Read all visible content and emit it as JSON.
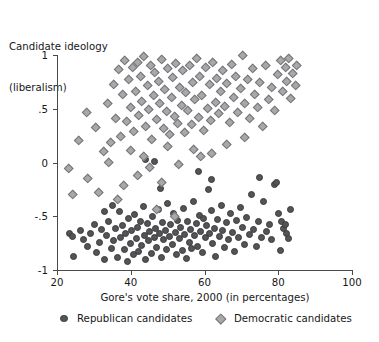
{
  "chart_data": {
    "type": "scatter",
    "title": "",
    "ylabel": "Candidate ideology (liberalism)",
    "ylabel_lines": [
      "Candidate ideology",
      "(liberalism)"
    ],
    "xlabel": "Gore's vote share, 2000 (in percentages)",
    "xlim": [
      20,
      100
    ],
    "ylim": [
      -1,
      1
    ],
    "xticks": [
      20,
      40,
      60,
      80,
      100
    ],
    "xtick_labels": [
      "20",
      "40",
      "60",
      "80",
      "100"
    ],
    "yticks": [
      1,
      0.5,
      0,
      -0.5,
      -1
    ],
    "ytick_labels": [
      "1",
      ".5",
      "0",
      "-.5",
      "-1"
    ],
    "grid": false,
    "legend_position": "bottom",
    "legend": [
      {
        "name": "Republican candidates",
        "marker": "circle",
        "color": "#545457"
      },
      {
        "name": "Democratic candidates",
        "marker": "diamond",
        "color": "#a8a8ab"
      }
    ],
    "series": [
      {
        "name": "Republican candidates",
        "marker": "circle",
        "color": "#545457",
        "points": [
          [
            23.4,
            -0.66
          ],
          [
            24.1,
            -0.69
          ],
          [
            24.6,
            -0.87
          ],
          [
            26.3,
            -0.63
          ],
          [
            27.1,
            -0.72
          ],
          [
            28.4,
            -0.78
          ],
          [
            29.2,
            -0.66
          ],
          [
            30.1,
            -0.58
          ],
          [
            30.8,
            -0.84
          ],
          [
            31.6,
            -0.74
          ],
          [
            32.2,
            -0.62
          ],
          [
            32.9,
            -0.9
          ],
          [
            33.5,
            -0.68
          ],
          [
            34.1,
            -0.55
          ],
          [
            34.8,
            -0.8
          ],
          [
            35.2,
            -0.73
          ],
          [
            35.9,
            -0.61
          ],
          [
            36.4,
            -0.88
          ],
          [
            36.9,
            -0.46
          ],
          [
            37.3,
            -0.7
          ],
          [
            37.8,
            -0.59
          ],
          [
            38.2,
            -0.81
          ],
          [
            38.7,
            -0.66
          ],
          [
            39.1,
            -0.92
          ],
          [
            39.5,
            -0.52
          ],
          [
            39.9,
            -0.75
          ],
          [
            40.3,
            -0.63
          ],
          [
            40.7,
            -0.86
          ],
          [
            41.1,
            -0.48
          ],
          [
            41.5,
            -0.71
          ],
          [
            41.9,
            -0.6
          ],
          [
            42.2,
            -0.83
          ],
          [
            42.6,
            -0.55
          ],
          [
            43.0,
            -0.77
          ],
          [
            43.4,
            -0.41
          ],
          [
            43.8,
            -0.68
          ],
          [
            44.1,
            -0.9
          ],
          [
            44.5,
            -0.57
          ],
          [
            44.9,
            -0.73
          ],
          [
            45.2,
            -0.64
          ],
          [
            45.6,
            -0.85
          ],
          [
            46.0,
            -0.5
          ],
          [
            46.4,
            -0.7
          ],
          [
            46.8,
            -0.61
          ],
          [
            47.1,
            -0.79
          ],
          [
            47.5,
            -0.44
          ],
          [
            47.9,
            -0.66
          ],
          [
            48.3,
            -0.88
          ],
          [
            48.6,
            -0.56
          ],
          [
            49.0,
            -0.72
          ],
          [
            49.4,
            -0.63
          ],
          [
            49.8,
            -0.81
          ],
          [
            50.1,
            -0.38
          ],
          [
            50.5,
            -0.69
          ],
          [
            50.9,
            -0.58
          ],
          [
            51.3,
            -0.76
          ],
          [
            51.7,
            -0.47
          ],
          [
            52.0,
            -0.65
          ],
          [
            52.4,
            -0.86
          ],
          [
            52.8,
            -0.54
          ],
          [
            53.2,
            -0.71
          ],
          [
            53.6,
            -0.6
          ],
          [
            54.0,
            -0.82
          ],
          [
            54.3,
            -0.43
          ],
          [
            54.7,
            -0.67
          ],
          [
            55.1,
            -0.89
          ],
          [
            55.5,
            -0.55
          ],
          [
            55.9,
            -0.74
          ],
          [
            56.2,
            -0.62
          ],
          [
            56.6,
            -0.8
          ],
          [
            57.0,
            -0.36
          ],
          [
            57.4,
            -0.68
          ],
          [
            57.8,
            -0.57
          ],
          [
            58.2,
            -0.78
          ],
          [
            58.6,
            -0.49
          ],
          [
            59.0,
            -0.64
          ],
          [
            59.4,
            -0.84
          ],
          [
            59.8,
            -0.52
          ],
          [
            60.2,
            -0.7
          ],
          [
            60.6,
            -0.59
          ],
          [
            61.0,
            -0.25
          ],
          [
            61.4,
            -0.66
          ],
          [
            61.8,
            -0.45
          ],
          [
            62.2,
            -0.75
          ],
          [
            62.7,
            -0.61
          ],
          [
            63.1,
            -0.87
          ],
          [
            63.5,
            -0.53
          ],
          [
            64.0,
            -0.69
          ],
          [
            64.5,
            -0.4
          ],
          [
            65.0,
            -0.63
          ],
          [
            65.5,
            -0.79
          ],
          [
            66.0,
            -0.56
          ],
          [
            66.5,
            -0.72
          ],
          [
            67.0,
            -0.47
          ],
          [
            67.6,
            -0.65
          ],
          [
            68.1,
            -0.83
          ],
          [
            68.7,
            -0.54
          ],
          [
            69.2,
            -0.7
          ],
          [
            69.8,
            -0.42
          ],
          [
            70.3,
            -0.6
          ],
          [
            70.9,
            -0.76
          ],
          [
            71.5,
            -0.51
          ],
          [
            72.1,
            -0.67
          ],
          [
            72.8,
            -0.3
          ],
          [
            73.4,
            -0.62
          ],
          [
            74.0,
            -0.78
          ],
          [
            74.7,
            -0.55
          ],
          [
            75.4,
            -0.7
          ],
          [
            76.0,
            -0.36
          ],
          [
            76.8,
            -0.64
          ],
          [
            77.5,
            -0.58
          ],
          [
            78.2,
            -0.72
          ],
          [
            79.0,
            -0.2
          ],
          [
            79.6,
            -0.19
          ],
          [
            80.2,
            -0.47
          ],
          [
            80.8,
            -0.55
          ],
          [
            81.4,
            -0.61
          ],
          [
            81.9,
            -0.58
          ],
          [
            82.3,
            -0.66
          ],
          [
            82.8,
            -0.71
          ],
          [
            83.2,
            -0.44
          ],
          [
            80.5,
            -0.82
          ],
          [
            62.0,
            -0.16
          ],
          [
            44.0,
            0.03
          ],
          [
            46.5,
            0.01
          ],
          [
            58.5,
            -0.08
          ],
          [
            48.0,
            -0.24
          ],
          [
            35.0,
            -0.4
          ],
          [
            33.0,
            -0.46
          ],
          [
            75.0,
            -0.14
          ]
        ]
      },
      {
        "name": "Democratic candidates",
        "marker": "diamond",
        "color": "#a8a8ab",
        "points": [
          [
            23.1,
            -0.06
          ],
          [
            24.2,
            -0.3
          ],
          [
            26.0,
            0.2
          ],
          [
            28.3,
            -0.15
          ],
          [
            30.5,
            0.32
          ],
          [
            31.4,
            -0.28
          ],
          [
            32.6,
            0.1
          ],
          [
            33.8,
            0.55
          ],
          [
            34.6,
            0.18
          ],
          [
            35.3,
            0.72
          ],
          [
            36.0,
            0.41
          ],
          [
            36.7,
            0.86
          ],
          [
            37.2,
            0.24
          ],
          [
            37.8,
            0.63
          ],
          [
            38.3,
            0.95
          ],
          [
            38.9,
            0.38
          ],
          [
            39.4,
            0.77
          ],
          [
            39.9,
            0.51
          ],
          [
            40.4,
            0.88
          ],
          [
            40.9,
            0.29
          ],
          [
            41.3,
            0.66
          ],
          [
            41.8,
            0.93
          ],
          [
            42.2,
            0.44
          ],
          [
            42.7,
            0.8
          ],
          [
            43.1,
            0.57
          ],
          [
            43.6,
            0.98
          ],
          [
            44.0,
            0.33
          ],
          [
            44.5,
            0.71
          ],
          [
            44.9,
            0.49
          ],
          [
            45.3,
            0.9
          ],
          [
            45.8,
            0.21
          ],
          [
            46.2,
            0.62
          ],
          [
            46.6,
            0.84
          ],
          [
            47.1,
            0.4
          ],
          [
            47.5,
            0.75
          ],
          [
            47.9,
            0.55
          ],
          [
            48.4,
            0.96
          ],
          [
            48.8,
            0.31
          ],
          [
            49.2,
            0.68
          ],
          [
            49.7,
            0.47
          ],
          [
            50.1,
            0.87
          ],
          [
            50.5,
            0.26
          ],
          [
            51.0,
            0.6
          ],
          [
            51.4,
            0.79
          ],
          [
            51.9,
            0.43
          ],
          [
            52.3,
            0.92
          ],
          [
            52.8,
            0.36
          ],
          [
            53.2,
            0.7
          ],
          [
            53.7,
            0.53
          ],
          [
            54.1,
            0.85
          ],
          [
            54.6,
            0.28
          ],
          [
            55.0,
            0.65
          ],
          [
            55.5,
            0.48
          ],
          [
            56.0,
            0.9
          ],
          [
            56.4,
            0.35
          ],
          [
            56.9,
            0.74
          ],
          [
            57.4,
            0.58
          ],
          [
            57.9,
            0.97
          ],
          [
            58.3,
            0.42
          ],
          [
            58.8,
            0.8
          ],
          [
            59.3,
            0.62
          ],
          [
            59.8,
            0.3
          ],
          [
            60.3,
            0.88
          ],
          [
            60.8,
            0.5
          ],
          [
            61.3,
            0.72
          ],
          [
            61.8,
            0.39
          ],
          [
            62.3,
            0.93
          ],
          [
            62.9,
            0.56
          ],
          [
            63.4,
            0.78
          ],
          [
            63.9,
            0.45
          ],
          [
            64.5,
            0.66
          ],
          [
            65.0,
            0.85
          ],
          [
            65.6,
            0.52
          ],
          [
            66.1,
            0.73
          ],
          [
            66.7,
            0.37
          ],
          [
            67.3,
            0.91
          ],
          [
            67.9,
            0.6
          ],
          [
            68.5,
            0.8
          ],
          [
            69.1,
            0.46
          ],
          [
            69.7,
            0.69
          ],
          [
            70.3,
            0.99
          ],
          [
            71.0,
            0.55
          ],
          [
            71.6,
            0.77
          ],
          [
            72.3,
            0.41
          ],
          [
            73.0,
            0.87
          ],
          [
            73.7,
            0.63
          ],
          [
            74.4,
            0.51
          ],
          [
            75.1,
            0.74
          ],
          [
            75.9,
            0.33
          ],
          [
            76.6,
            0.9
          ],
          [
            77.4,
            0.58
          ],
          [
            78.2,
            0.7
          ],
          [
            79.0,
            0.48
          ],
          [
            79.9,
            0.82
          ],
          [
            80.7,
            0.95
          ],
          [
            81.3,
            0.66
          ],
          [
            81.9,
            0.88
          ],
          [
            82.4,
            0.75
          ],
          [
            82.9,
            0.97
          ],
          [
            83.5,
            0.59
          ],
          [
            84.0,
            0.83
          ],
          [
            84.6,
            0.71
          ],
          [
            85.1,
            0.9
          ],
          [
            62.0,
            0.08
          ],
          [
            57.0,
            0.12
          ],
          [
            43.5,
            0.05
          ],
          [
            40.0,
            0.11
          ],
          [
            45.0,
            -0.05
          ],
          [
            50.0,
            0.15
          ],
          [
            53.0,
            -0.02
          ],
          [
            66.0,
            0.17
          ],
          [
            71.0,
            0.23
          ],
          [
            47.0,
            -0.44
          ],
          [
            52.0,
            -0.5
          ],
          [
            36.5,
            -0.35
          ],
          [
            38.0,
            -0.22
          ],
          [
            42.0,
            -0.12
          ],
          [
            48.5,
            -0.19
          ],
          [
            34.0,
            0.0
          ],
          [
            59.0,
            0.05
          ],
          [
            28.0,
            0.46
          ]
        ]
      }
    ]
  },
  "legend_labels": {
    "republican": "Republican candidates",
    "democratic": "Democratic candidates"
  }
}
